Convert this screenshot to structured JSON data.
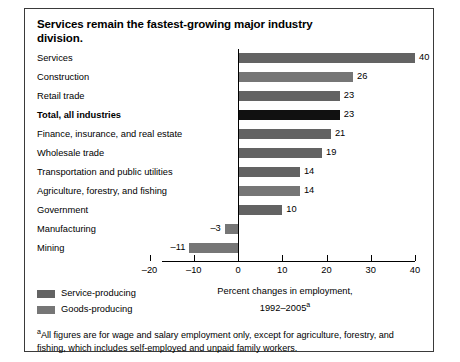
{
  "figure": {
    "title": "Services remain the fastest-growing major industry division.",
    "axis_caption_line1": "Percent changes in employment,",
    "axis_caption_line2": "1992–2005",
    "axis_caption_marker": "a",
    "footnote_marker": "a",
    "footnote": "All figures are for wage and salary employment only, except for agriculture, forestry, and fishing, which includes self-employed and unpaid family workers."
  },
  "legend": {
    "items": [
      {
        "label": "Service-producing",
        "color": "#636363",
        "key": "service"
      },
      {
        "label": "Goods-producing",
        "color": "#767676",
        "key": "goods"
      }
    ]
  },
  "chart_data": {
    "type": "bar",
    "orientation": "horizontal",
    "title": "Services remain the fastest-growing major industry division.",
    "xlabel": "Percent changes in employment, 1992–2005",
    "ylabel": "",
    "xlim": [
      -20,
      40
    ],
    "xticks": [
      -20,
      -10,
      0,
      10,
      20,
      30,
      40
    ],
    "xtick_labels": [
      "–20",
      "–10",
      "0",
      "10",
      "20",
      "30",
      "40"
    ],
    "grid": false,
    "legend_position": "bottom-left",
    "categories": [
      "Services",
      "Construction",
      "Retail trade",
      "Total, all industries",
      "Finance, insurance, and real estate",
      "Wholesale trade",
      "Transportation and public utilities",
      "Agriculture, forestry, and fishing",
      "Government",
      "Manufacturing",
      "Mining"
    ],
    "values": [
      40,
      26,
      23,
      23,
      21,
      19,
      14,
      14,
      10,
      -3,
      -11
    ],
    "value_labels": [
      "40",
      "26",
      "23",
      "23",
      "21",
      "19",
      "14",
      "14",
      "10",
      "–3",
      "–11"
    ],
    "series_key": [
      "service",
      "goods",
      "service",
      "total",
      "service",
      "service",
      "service",
      "goods",
      "service",
      "goods",
      "goods"
    ],
    "emphasis": [
      false,
      false,
      false,
      true,
      false,
      false,
      false,
      false,
      false,
      false,
      false
    ]
  }
}
